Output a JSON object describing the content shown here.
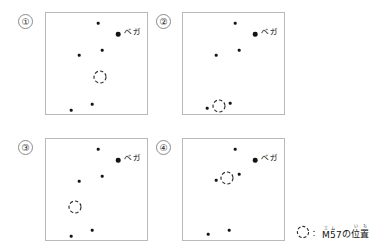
{
  "figure": {
    "background_color": "#ffffff",
    "star_color": "#141414",
    "box_border_color": "#b9b9b9",
    "ring_color": "#2a2a2a"
  },
  "legend": {
    "icon": "dashed-circle-icon",
    "separator": "：",
    "label_plain": "M57の位置",
    "label_parts": [
      {
        "base": "M",
        "ruby": "エ"
      },
      {
        "base": "5",
        "ruby": "ム"
      },
      {
        "base": "7",
        "ruby": ""
      },
      {
        "base": "の",
        "ruby": ""
      },
      {
        "base": "位",
        "ruby": "い"
      },
      {
        "base": "置",
        "ruby": "ち"
      }
    ]
  },
  "panels": [
    {
      "number": "①",
      "vega_label": "ベガ",
      "vega": {
        "x": 72,
        "y": 21
      },
      "vega_label_pos": {
        "x": 78,
        "y": 19
      },
      "m57": {
        "x": 54,
        "y": 64
      },
      "stars": [
        {
          "x": 52,
          "y": 10,
          "size": "sm"
        },
        {
          "x": 56,
          "y": 37,
          "size": "sm"
        },
        {
          "x": 33,
          "y": 42,
          "size": "sm"
        },
        {
          "x": 46,
          "y": 91,
          "size": "sm"
        },
        {
          "x": 25,
          "y": 97,
          "size": "sm"
        }
      ]
    },
    {
      "number": "②",
      "vega_label": "ベガ",
      "vega": {
        "x": 72,
        "y": 21
      },
      "vega_label_pos": {
        "x": 78,
        "y": 19
      },
      "m57": {
        "x": 36,
        "y": 93
      },
      "stars": [
        {
          "x": 52,
          "y": 10,
          "size": "sm"
        },
        {
          "x": 56,
          "y": 37,
          "size": "sm"
        },
        {
          "x": 33,
          "y": 42,
          "size": "sm"
        },
        {
          "x": 47,
          "y": 90,
          "size": "sm"
        },
        {
          "x": 24,
          "y": 95,
          "size": "sm"
        }
      ]
    },
    {
      "number": "③",
      "vega_label": "ベガ",
      "vega": {
        "x": 72,
        "y": 21
      },
      "vega_label_pos": {
        "x": 78,
        "y": 19
      },
      "m57": {
        "x": 29,
        "y": 68
      },
      "stars": [
        {
          "x": 52,
          "y": 10,
          "size": "sm"
        },
        {
          "x": 56,
          "y": 37,
          "size": "sm"
        },
        {
          "x": 33,
          "y": 42,
          "size": "sm"
        },
        {
          "x": 46,
          "y": 91,
          "size": "sm"
        },
        {
          "x": 25,
          "y": 97,
          "size": "sm"
        }
      ]
    },
    {
      "number": "④",
      "vega_label": "ベガ",
      "vega": {
        "x": 72,
        "y": 21
      },
      "vega_label_pos": {
        "x": 78,
        "y": 19
      },
      "m57": {
        "x": 44,
        "y": 39
      },
      "stars": [
        {
          "x": 52,
          "y": 10,
          "size": "sm"
        },
        {
          "x": 56,
          "y": 35,
          "size": "sm"
        },
        {
          "x": 33,
          "y": 41,
          "size": "sm"
        },
        {
          "x": 46,
          "y": 91,
          "size": "sm"
        },
        {
          "x": 25,
          "y": 95,
          "size": "sm"
        }
      ]
    }
  ],
  "panel_layout": [
    {
      "number_x": 18,
      "number_y": 14,
      "box_x": 45,
      "box_y": 12
    },
    {
      "number_x": 156,
      "number_y": 14,
      "box_x": 182,
      "box_y": 12
    },
    {
      "number_x": 18,
      "number_y": 140,
      "box_x": 45,
      "box_y": 138
    },
    {
      "number_x": 156,
      "number_y": 140,
      "box_x": 182,
      "box_y": 138
    }
  ]
}
